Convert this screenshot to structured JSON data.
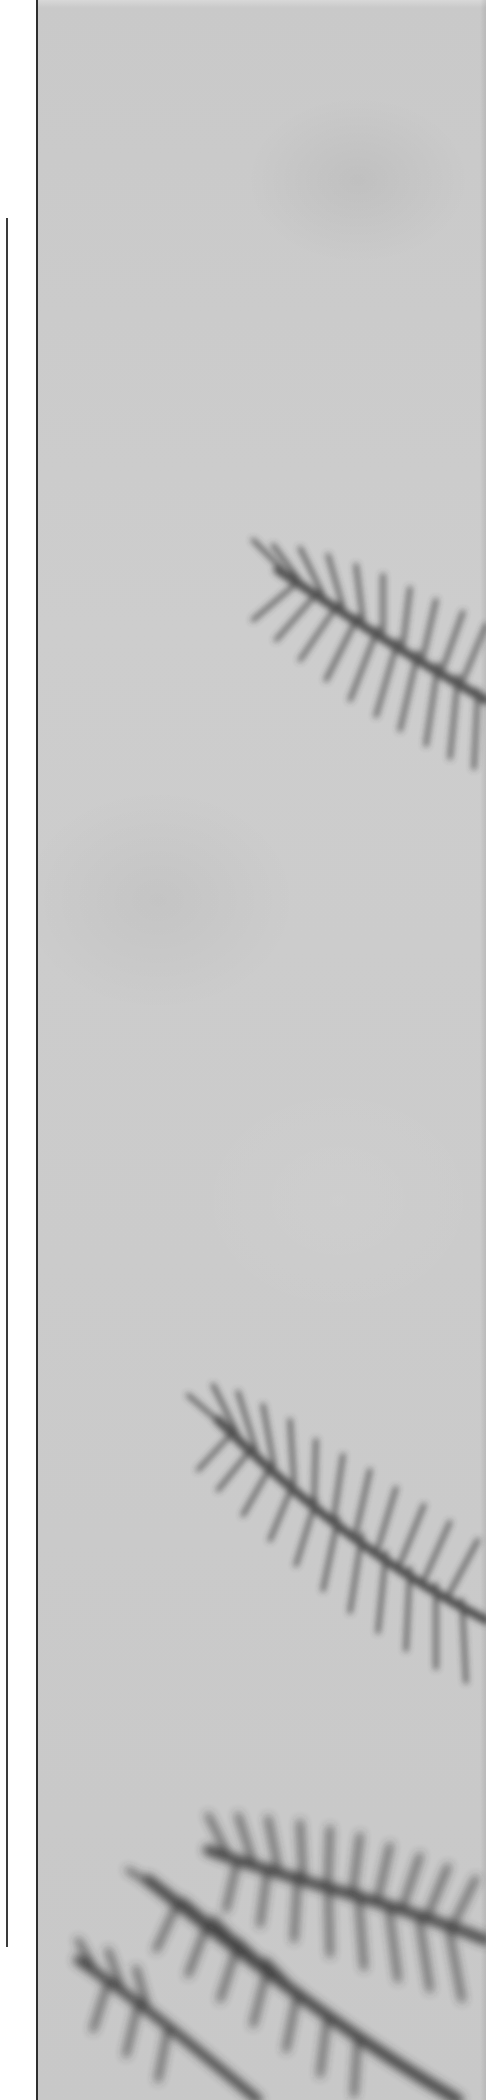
{
  "layout": {
    "margin_width_px": 36,
    "rule_line": {
      "x": 6,
      "top": 218,
      "bottom": 1947,
      "color": "#3a3a3a"
    }
  },
  "photo": {
    "subject": "pine branches",
    "tone": "grayscale",
    "sky_color": "#cbcbcb",
    "foliage_color": "#3c3c3c",
    "border_color": "#2e2e2e",
    "branches": [
      {
        "name": "upper-branch",
        "region": "right edge around y 520-760"
      },
      {
        "name": "middle-branch",
        "region": "center-right around y 1370-1680"
      },
      {
        "name": "lower-branches",
        "region": "bottom area y 1800-2100"
      }
    ]
  }
}
